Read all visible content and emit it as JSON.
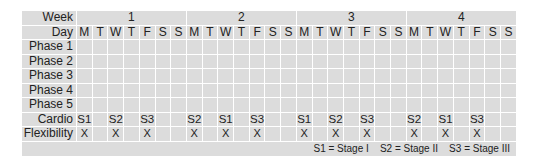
{
  "table": {
    "row_labels": {
      "week": "Week",
      "day": "Day",
      "phases": [
        "Phase 1",
        "Phase 2",
        "Phase 3",
        "Phase 4",
        "Phase 5"
      ],
      "cardio": "Cardio",
      "flexibility": "Flexibility"
    },
    "weeks": [
      "1",
      "2",
      "3",
      "4"
    ],
    "days": [
      "M",
      "T",
      "W",
      "T",
      "F",
      "S",
      "S",
      "M",
      "T",
      "W",
      "T",
      "F",
      "S",
      "S",
      "M",
      "T",
      "W",
      "T",
      "F",
      "S",
      "S",
      "M",
      "T",
      "W",
      "T",
      "F",
      "S",
      "S"
    ],
    "cardio": [
      "S1",
      "",
      "S2",
      "",
      "S3",
      "",
      "",
      "S2",
      "",
      "S1",
      "",
      "S3",
      "",
      "",
      "S1",
      "",
      "S2",
      "",
      "S3",
      "",
      "",
      "S2",
      "",
      "S1",
      "",
      "S3",
      "",
      ""
    ],
    "flexibility": [
      "X",
      "",
      "X",
      "",
      "X",
      "",
      "",
      "X",
      "",
      "X",
      "",
      "X",
      "",
      "",
      "X",
      "",
      "X",
      "",
      "X",
      "",
      "",
      "X",
      "",
      "X",
      "",
      "X",
      "",
      ""
    ],
    "legend": "S1 = Stage I    S2 = Stage II    S3 = Stage III"
  }
}
